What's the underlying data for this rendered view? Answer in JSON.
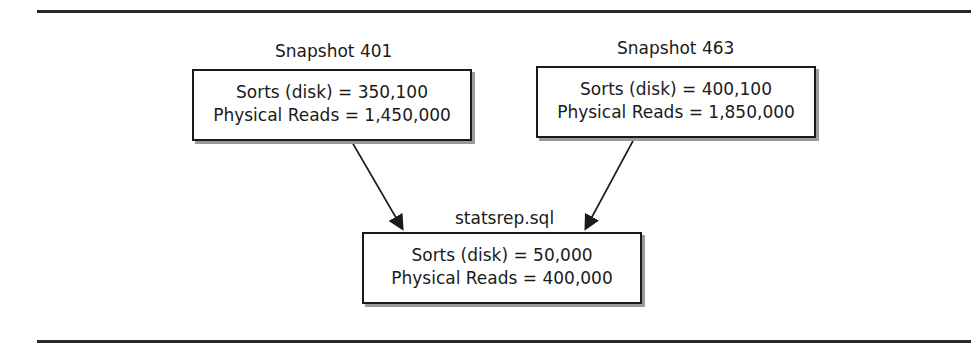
{
  "diagram": {
    "nodes": [
      {
        "id": "snapshot-401",
        "title": "Snapshot 401",
        "lines": [
          "Sorts (disk) = 350,100",
          "Physical Reads = 1,450,000"
        ]
      },
      {
        "id": "snapshot-463",
        "title": "Snapshot 463",
        "lines": [
          "Sorts (disk) = 400,100",
          "Physical Reads = 1,850,000"
        ]
      },
      {
        "id": "statsrep",
        "title": "statsrep.sql",
        "lines": [
          "Sorts (disk) = 50,000",
          "Physical Reads = 400,000"
        ]
      }
    ],
    "edges": [
      {
        "from": "snapshot-401",
        "to": "statsrep"
      },
      {
        "from": "snapshot-463",
        "to": "statsrep"
      }
    ]
  }
}
